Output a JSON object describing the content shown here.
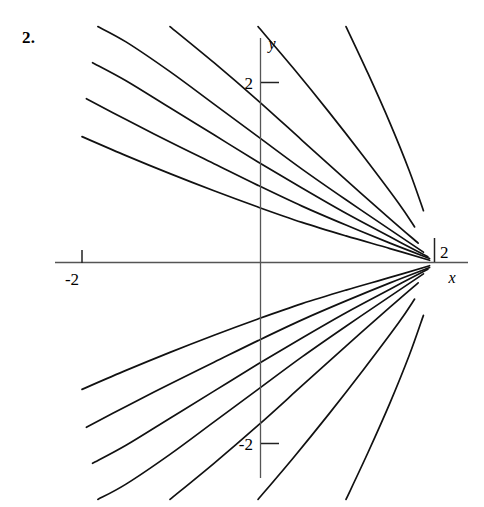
{
  "problem": {
    "number": "2."
  },
  "axes": {
    "x_axis_label": "x",
    "y_axis_label": "y",
    "x_tick_negative_label": "-2",
    "x_tick_positive_label": "2",
    "y_tick_positive_label": "2",
    "y_tick_negative_label": "-2",
    "line_color": "#555555",
    "curve_color": "#111111"
  },
  "chart_data": {
    "type": "line",
    "title": "",
    "subtitle": "",
    "xlabel": "x",
    "ylabel": "y",
    "xlim": [
      -2.3,
      2.35
    ],
    "ylim": [
      -2.6,
      2.6
    ],
    "xticks": [
      -2,
      2
    ],
    "xticklabels": [
      "-2",
      "2"
    ],
    "yticks": [
      -2,
      2
    ],
    "yticklabels": [
      "-2",
      "2"
    ],
    "grid": false,
    "legend": null,
    "convergence_point": [
      2,
      0
    ],
    "series": [
      {
        "name": "curve-upper-1",
        "points": [
          [
            -2.0,
            1.4
          ],
          [
            -1.5,
            1.19
          ],
          [
            -1.0,
            0.99
          ],
          [
            -0.5,
            0.8
          ],
          [
            0.0,
            0.62
          ],
          [
            0.5,
            0.45
          ],
          [
            1.0,
            0.3
          ],
          [
            1.5,
            0.16
          ],
          [
            1.95,
            0.03
          ]
        ]
      },
      {
        "name": "curve-upper-2",
        "points": [
          [
            -1.95,
            1.82
          ],
          [
            -1.5,
            1.59
          ],
          [
            -1.0,
            1.34
          ],
          [
            -0.5,
            1.1
          ],
          [
            0.0,
            0.86
          ],
          [
            0.5,
            0.63
          ],
          [
            1.0,
            0.42
          ],
          [
            1.5,
            0.22
          ],
          [
            1.95,
            0.05
          ]
        ]
      },
      {
        "name": "curve-upper-3",
        "points": [
          [
            -1.88,
            2.22
          ],
          [
            -1.5,
            2.02
          ],
          [
            -1.0,
            1.72
          ],
          [
            -0.5,
            1.42
          ],
          [
            0.0,
            1.12
          ],
          [
            0.5,
            0.83
          ],
          [
            1.0,
            0.55
          ],
          [
            1.5,
            0.29
          ],
          [
            1.93,
            0.07
          ]
        ]
      },
      {
        "name": "curve-upper-4",
        "points": [
          [
            -1.82,
            2.62
          ],
          [
            -1.5,
            2.45
          ],
          [
            -1.0,
            2.12
          ],
          [
            -0.5,
            1.76
          ],
          [
            0.0,
            1.4
          ],
          [
            0.5,
            1.04
          ],
          [
            1.0,
            0.7
          ],
          [
            1.5,
            0.37
          ],
          [
            1.88,
            0.12
          ]
        ]
      },
      {
        "name": "curve-upper-5",
        "points": [
          [
            -1.0,
            2.62
          ],
          [
            -0.5,
            2.22
          ],
          [
            0.0,
            1.8
          ],
          [
            0.5,
            1.36
          ],
          [
            1.0,
            0.92
          ],
          [
            1.5,
            0.49
          ],
          [
            1.82,
            0.22
          ]
        ]
      },
      {
        "name": "curve-upper-6",
        "points": [
          [
            0.0,
            2.62
          ],
          [
            0.4,
            2.16
          ],
          [
            0.8,
            1.68
          ],
          [
            1.2,
            1.18
          ],
          [
            1.6,
            0.66
          ],
          [
            1.78,
            0.4
          ]
        ]
      },
      {
        "name": "curve-upper-7",
        "points": [
          [
            1.0,
            2.62
          ],
          [
            1.25,
            2.1
          ],
          [
            1.5,
            1.55
          ],
          [
            1.72,
            1.02
          ],
          [
            1.88,
            0.58
          ]
        ]
      },
      {
        "name": "curve-lower-1",
        "points": [
          [
            -2.0,
            -1.4
          ],
          [
            -1.5,
            -1.19
          ],
          [
            -1.0,
            -0.99
          ],
          [
            -0.5,
            -0.8
          ],
          [
            0.0,
            -0.62
          ],
          [
            0.5,
            -0.45
          ],
          [
            1.0,
            -0.3
          ],
          [
            1.5,
            -0.16
          ],
          [
            1.95,
            -0.03
          ]
        ]
      },
      {
        "name": "curve-lower-2",
        "points": [
          [
            -1.95,
            -1.82
          ],
          [
            -1.5,
            -1.59
          ],
          [
            -1.0,
            -1.34
          ],
          [
            -0.5,
            -1.1
          ],
          [
            0.0,
            -0.86
          ],
          [
            0.5,
            -0.63
          ],
          [
            1.0,
            -0.42
          ],
          [
            1.5,
            -0.22
          ],
          [
            1.95,
            -0.05
          ]
        ]
      },
      {
        "name": "curve-lower-3",
        "points": [
          [
            -1.88,
            -2.22
          ],
          [
            -1.5,
            -2.02
          ],
          [
            -1.0,
            -1.72
          ],
          [
            -0.5,
            -1.42
          ],
          [
            0.0,
            -1.12
          ],
          [
            0.5,
            -0.83
          ],
          [
            1.0,
            -0.55
          ],
          [
            1.5,
            -0.29
          ],
          [
            1.93,
            -0.07
          ]
        ]
      },
      {
        "name": "curve-lower-4",
        "points": [
          [
            -1.82,
            -2.62
          ],
          [
            -1.5,
            -2.45
          ],
          [
            -1.0,
            -2.12
          ],
          [
            -0.5,
            -1.76
          ],
          [
            0.0,
            -1.4
          ],
          [
            0.5,
            -1.04
          ],
          [
            1.0,
            -0.7
          ],
          [
            1.5,
            -0.37
          ],
          [
            1.88,
            -0.12
          ]
        ]
      },
      {
        "name": "curve-lower-5",
        "points": [
          [
            -1.0,
            -2.62
          ],
          [
            -0.5,
            -2.22
          ],
          [
            0.0,
            -1.8
          ],
          [
            0.5,
            -1.36
          ],
          [
            1.0,
            -0.92
          ],
          [
            1.5,
            -0.49
          ],
          [
            1.82,
            -0.22
          ]
        ]
      },
      {
        "name": "curve-lower-6",
        "points": [
          [
            0.0,
            -2.62
          ],
          [
            0.4,
            -2.16
          ],
          [
            0.8,
            -1.68
          ],
          [
            1.2,
            -1.18
          ],
          [
            1.6,
            -0.66
          ],
          [
            1.78,
            -0.4
          ]
        ]
      },
      {
        "name": "curve-lower-7",
        "points": [
          [
            1.0,
            -2.62
          ],
          [
            1.25,
            -2.1
          ],
          [
            1.5,
            -1.55
          ],
          [
            1.72,
            -1.02
          ],
          [
            1.88,
            -0.58
          ]
        ]
      }
    ]
  }
}
